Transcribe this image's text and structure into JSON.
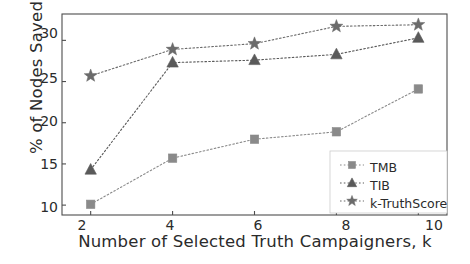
{
  "chart_data": {
    "type": "line",
    "title": "",
    "xlabel": "Number of Selected Truth Campaigners, k",
    "ylabel": "% of Nodes Saved",
    "x": [
      2,
      4,
      6,
      8,
      10
    ],
    "xtick_labels": [
      "2",
      "4",
      "6",
      "8",
      "10"
    ],
    "ytick_labels": [
      "10",
      "15",
      "20",
      "25",
      "30"
    ],
    "yticks": [
      10,
      15,
      20,
      25,
      30
    ],
    "xlim": [
      1.3,
      10.7
    ],
    "ylim": [
      8.8,
      33.2
    ],
    "grid": false,
    "legend_position": "lower right",
    "series": [
      {
        "name": "TMB",
        "marker": "square",
        "color": "#8a8a8a",
        "linestyle": "dotted",
        "values": [
          10.1,
          15.7,
          18.0,
          18.9,
          24.1
        ]
      },
      {
        "name": "TIB",
        "marker": "triangle",
        "color": "#5a5a5a",
        "linestyle": "dotted",
        "values": [
          14.3,
          27.3,
          27.6,
          28.3,
          30.3
        ]
      },
      {
        "name": "k-TruthScore",
        "marker": "star",
        "color": "#6b6b6b",
        "linestyle": "dotted",
        "values": [
          25.7,
          28.9,
          29.6,
          31.7,
          31.9
        ]
      }
    ]
  },
  "legend": {
    "items": [
      {
        "label": "TMB",
        "marker": "square-marker-icon"
      },
      {
        "label": "TIB",
        "marker": "triangle-marker-icon"
      },
      {
        "label": "k-TruthScore",
        "marker": "star-marker-icon"
      }
    ]
  },
  "axes": {
    "frame_color": "#4d4d4d",
    "text_color": "#2b2b2b"
  }
}
